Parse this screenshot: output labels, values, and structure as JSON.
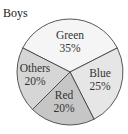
{
  "chart_data": {
    "type": "pie",
    "title": "Boys",
    "categories": [
      "Green",
      "Blue",
      "Red",
      "Others"
    ],
    "values": [
      35,
      25,
      20,
      20
    ],
    "labels": [
      "35%",
      "25%",
      "20%",
      "20%"
    ],
    "colors": [
      "#f5f5f5",
      "#e6e6e6",
      "#c6c6c6",
      "#d6d6d6"
    ],
    "legend": "none",
    "start_angle_deg": -63,
    "direction": "clockwise"
  },
  "title": "Boys",
  "slices": [
    {
      "name": "Green",
      "pct": "35%"
    },
    {
      "name": "Blue",
      "pct": "25%"
    },
    {
      "name": "Red",
      "pct": "20%"
    },
    {
      "name": "Others",
      "pct": "20%"
    }
  ]
}
